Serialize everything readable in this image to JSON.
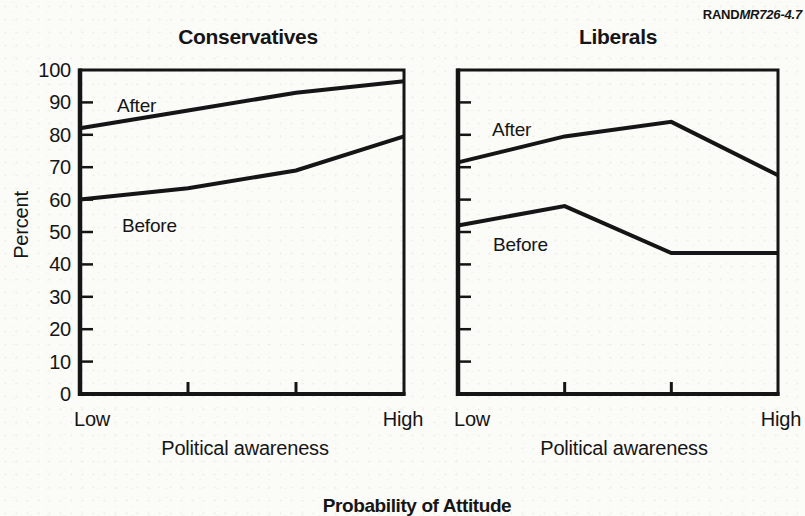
{
  "figure_id": {
    "prefix": "RAND",
    "code": "MR726-4.7"
  },
  "caption": "Probability of Attitude",
  "colors": {
    "ink": "#151515",
    "paper": "#fbfbf8"
  },
  "chart_data": [
    {
      "type": "line",
      "title": "Conservatives",
      "ylabel": "Percent",
      "xlabel": "Political awareness",
      "x_axis_labels": [
        "Low",
        "High"
      ],
      "ylim": [
        0,
        100
      ],
      "y_tick_step": 10,
      "y_tick_labels_visible": true,
      "grid": false,
      "legend": "inline-labels",
      "categories": [
        "Low",
        "",
        "",
        "High"
      ],
      "series": [
        {
          "name": "After",
          "values": [
            82,
            87.5,
            93,
            96.5
          ]
        },
        {
          "name": "Before",
          "values": [
            60,
            63.5,
            69,
            79.5
          ]
        }
      ]
    },
    {
      "type": "line",
      "title": "Liberals",
      "ylabel": "",
      "xlabel": "Political awareness",
      "x_axis_labels": [
        "Low",
        "High"
      ],
      "ylim": [
        0,
        100
      ],
      "y_tick_step": 10,
      "y_tick_labels_visible": false,
      "grid": false,
      "legend": "inline-labels",
      "categories": [
        "Low",
        "",
        "",
        "High"
      ],
      "series": [
        {
          "name": "After",
          "values": [
            71.5,
            79.5,
            84,
            67.5
          ]
        },
        {
          "name": "Before",
          "values": [
            52,
            58,
            43.5,
            43.5
          ]
        }
      ]
    }
  ]
}
